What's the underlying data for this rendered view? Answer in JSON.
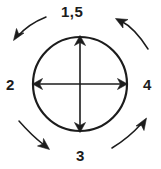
{
  "figure": {
    "type": "mechanics-diagram",
    "background_color": "#ffffff",
    "stroke_color": "#1c1c1c",
    "labels": {
      "top": "1,5",
      "left": "2",
      "right": "4",
      "bottom": "3"
    },
    "shapes": {
      "circle": {
        "name": "circle-outline",
        "center_x": 80,
        "center_y": 84,
        "radius": 47,
        "stroke_width": 2.2
      },
      "vertical_diameter": {
        "name": "vertical-double-arrow",
        "x": 80,
        "y_top": 37,
        "y_bottom": 131,
        "heads": "both"
      },
      "horizontal_diameter": {
        "name": "horizontal-double-arrow",
        "y": 84,
        "x_left": 33,
        "x_right": 127,
        "heads": "both"
      }
    },
    "curved_arrows": [
      {
        "name": "arrow-top-left",
        "direction": "down-left",
        "head_x": 14,
        "head_y": 40
      },
      {
        "name": "arrow-top-right",
        "direction": "up-left",
        "head_x": 117,
        "head_y": 19
      },
      {
        "name": "arrow-bottom-left",
        "direction": "down-right",
        "head_x": 49,
        "head_y": 149
      },
      {
        "name": "arrow-bottom-right",
        "direction": "up-right",
        "head_x": 146,
        "head_y": 119
      }
    ]
  }
}
